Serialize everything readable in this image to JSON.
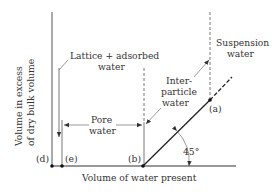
{
  "y_axis_label": [
    "Volume in excess",
    "of dry bulk volume"
  ],
  "x_axis_label": "Volume of water present",
  "labels": {
    "lattice": [
      "Lattice + adsorbed",
      "water"
    ],
    "pore": [
      "Pore",
      "water"
    ],
    "interparticle": [
      "Inter-",
      "particle",
      "water"
    ],
    "suspension": [
      "Suspension",
      "water"
    ],
    "angle": "45°"
  },
  "points": {
    "a": "(a)",
    "b": "(b)",
    "d": "(d)",
    "e": "(e)"
  },
  "colors": {
    "line": "#333333",
    "background": "#ffffff"
  }
}
